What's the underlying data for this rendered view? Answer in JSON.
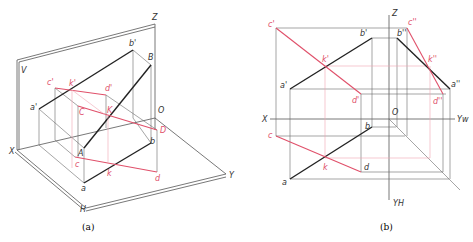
{
  "colors": {
    "black": "#222222",
    "red": "#e0506a",
    "grey": "#6a6a6a",
    "pink_light": "#f0a6b4"
  },
  "figure_a": {
    "caption": "(a)",
    "axis_labels": {
      "Z": "Z",
      "X": "X",
      "Y": "Y",
      "O": "O",
      "V": "V",
      "H": "H"
    },
    "point_labels": {
      "a_prime": "a'",
      "b_prime": "b'",
      "c_prime": "c'",
      "d_prime": "d'",
      "k_prime": "k'",
      "A": "A",
      "B": "B",
      "C": "C",
      "D": "D",
      "K": "K",
      "a": "a",
      "b": "b",
      "c": "c",
      "d": "d",
      "k": "k"
    }
  },
  "figure_b": {
    "caption": "(b)",
    "axis_labels": {
      "Z": "Z",
      "X": "X",
      "O": "O",
      "Yw": "Yw",
      "Yh": "YH"
    },
    "point_labels": {
      "c_prime": "c'",
      "b_prime": "b'",
      "k_prime": "k'",
      "a_prime": "a'",
      "d_prime": "d'",
      "b_dprime": "b''",
      "c_dprime": "c''",
      "k_dprime": "k''",
      "a_dprime": "a''",
      "d_dprime": "d''",
      "a": "a",
      "b": "b",
      "c": "c",
      "d": "d",
      "k": "k"
    }
  }
}
